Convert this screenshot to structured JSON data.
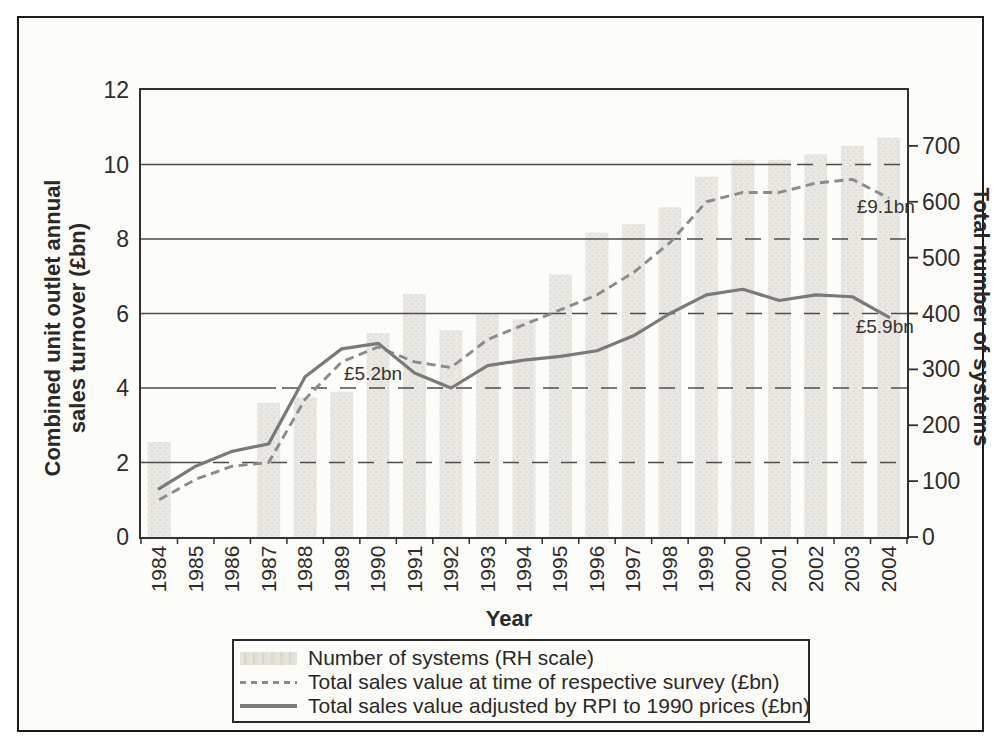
{
  "colors": {
    "ink": "#2f2d2b",
    "frame": "#1c1c1c",
    "bar_fill": "#eae8e3",
    "bar_texture": "#e0ddd6",
    "dashed_line": "#8b8b8b",
    "solid_line": "#7a7a7a",
    "gridline": "#4c4c4c",
    "background": "#fcfcf9"
  },
  "chart_data": {
    "type": "bar+line combo, dual axis",
    "x": [
      "1984",
      "1985",
      "1986",
      "1987",
      "1988",
      "1989",
      "1990",
      "1991",
      "1992",
      "1993",
      "1994",
      "1995",
      "1996",
      "1997",
      "1998",
      "1999",
      "2000",
      "2001",
      "2002",
      "2003",
      "2004"
    ],
    "xlabel": "Year",
    "left_axis": {
      "label": "Combined unit outlet annual sales turnover (£bn)",
      "label_lines": [
        "Combined unit outlet annual",
        "sales turnover (£bn)"
      ],
      "min": 0,
      "max": 12,
      "ticks": [
        0,
        2,
        4,
        6,
        8,
        10,
        12
      ],
      "gridlines": [
        2,
        4,
        6,
        8,
        10
      ]
    },
    "right_axis": {
      "label": "Total number of systems",
      "min": 0,
      "max": 800,
      "ticks": [
        0,
        100,
        200,
        300,
        400,
        500,
        600,
        700
      ]
    },
    "series": [
      {
        "name": "Number of systems (RH scale)",
        "type": "bar",
        "axis": "right",
        "values": [
          170,
          null,
          null,
          240,
          250,
          260,
          365,
          435,
          370,
          400,
          390,
          470,
          545,
          560,
          590,
          645,
          675,
          675,
          685,
          700,
          715
        ]
      },
      {
        "name": "Total sales value at time of respective survey (£bn)",
        "type": "line",
        "style": "dashed",
        "axis": "left",
        "values": [
          1.0,
          1.55,
          1.9,
          2.0,
          3.7,
          4.7,
          5.1,
          4.7,
          4.55,
          5.3,
          5.7,
          6.1,
          6.5,
          7.1,
          7.9,
          9.0,
          9.25,
          9.25,
          9.5,
          9.6,
          9.1
        ]
      },
      {
        "name": "Total sales value adjusted by RPI to 1990 prices (£bn)",
        "type": "line",
        "style": "solid",
        "axis": "left",
        "values": [
          1.3,
          1.9,
          2.3,
          2.5,
          4.3,
          5.05,
          5.2,
          4.4,
          4.0,
          4.6,
          4.75,
          4.85,
          5.0,
          5.4,
          6.0,
          6.5,
          6.65,
          6.35,
          6.5,
          6.45,
          5.9
        ]
      }
    ],
    "annotations": [
      {
        "text": "£5.2bn",
        "year": "1990",
        "series": "solid",
        "value": 5.2
      },
      {
        "text": "£9.1bn",
        "year": "2004",
        "series": "dashed",
        "value": 9.1
      },
      {
        "text": "£5.9bn",
        "year": "2004",
        "series": "solid",
        "value": 5.9
      }
    ],
    "legend_position": "bottom"
  },
  "legend": {
    "items": [
      {
        "label": "Number of systems (RH scale)",
        "swatch": "bar"
      },
      {
        "label": "Total sales value at time of respective survey (£bn)",
        "swatch": "dashed-line"
      },
      {
        "label": "Total sales value adjusted by RPI to 1990 prices (£bn)",
        "swatch": "solid-line"
      }
    ]
  }
}
